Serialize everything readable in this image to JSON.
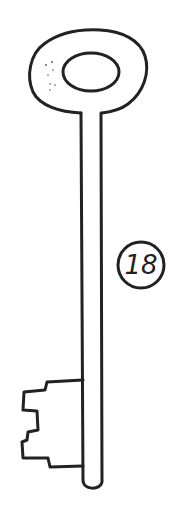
{
  "drawing": {
    "subject": "key",
    "label": "18",
    "colors": {
      "ink": "#222222",
      "paper": "#ffffff"
    }
  }
}
